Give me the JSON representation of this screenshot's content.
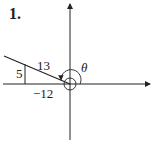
{
  "problem_number": "1.",
  "labels": {
    "hypotenuse": "13",
    "opposite": "5",
    "adjacent": "−12",
    "angle": "θ"
  },
  "colors": {
    "line": "#222222",
    "background": "#ffffff"
  }
}
